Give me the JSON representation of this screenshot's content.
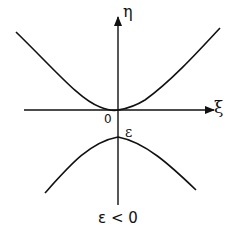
{
  "figure": {
    "x_axis_label": "ξ",
    "y_axis_label": "η",
    "origin_label": "0",
    "gap_label": "ε",
    "caption": "ε < 0",
    "line_color": "#111111",
    "background": "#ffffff"
  },
  "curves": [
    {
      "name": "upper-branch",
      "shape": "convex",
      "vertex": [
        0,
        0
      ],
      "description": "touches origin"
    },
    {
      "name": "lower-branch",
      "shape": "concave",
      "vertex": [
        0,
        "ε"
      ],
      "description": "maximum at ε below axis"
    }
  ]
}
